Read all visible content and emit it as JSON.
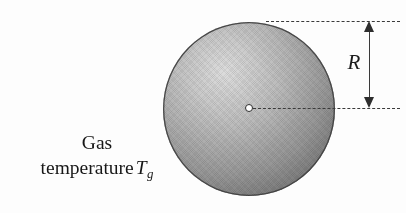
{
  "figure": {
    "name": "sphere-in-gas-radius-diagram",
    "background_color": "#fdfdfd",
    "width": 406,
    "height": 213
  },
  "sphere": {
    "name": "shaded-sphere",
    "center_x": 249,
    "center_y": 109,
    "diameter": 172,
    "radius": 86,
    "highlight_color": "#dcdcdc",
    "shadow_color": "#686868",
    "outline_color": "#4a4a4a",
    "highlight_position": "upper-left"
  },
  "center_marker": {
    "name": "sphere-center-point",
    "x": 249,
    "y": 108,
    "diameter": 8,
    "fill_color": "#ffffff",
    "stroke_color": "#2f2f2f"
  },
  "construction_lines": [
    {
      "name": "top-tangent-dashed-line",
      "y": 21,
      "x_start": 266,
      "x_end": 400,
      "style": "dashed",
      "color": "#3a3a3a"
    },
    {
      "name": "radius-dashed-line",
      "y": 108,
      "x_start": 253,
      "x_end": 400,
      "style": "dashed",
      "color": "#3a3a3a"
    }
  ],
  "dimension": {
    "name": "radius-dimension-arrow",
    "label": "R",
    "orientation": "vertical",
    "x": 370,
    "y_top": 21,
    "y_bottom": 108,
    "length": 87,
    "arrowheads": "both",
    "color": "#2e2e2e"
  },
  "caption": {
    "name": "gas-temperature-caption",
    "line1": "Gas",
    "line2_prefix": "temperature",
    "symbol": "T",
    "subscript": "g",
    "color": "#171717"
  }
}
